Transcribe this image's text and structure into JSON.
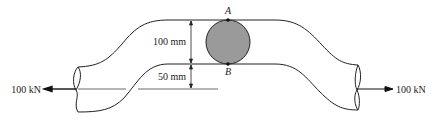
{
  "figure": {
    "type": "offset-bar-tension-diagram",
    "colors": {
      "stroke": "#222222",
      "section_fill": "#9a9a9a",
      "background": "#ffffff"
    }
  },
  "labels": {
    "point_top": "A",
    "point_bottom": "B",
    "dim_upper": "100 mm",
    "dim_lower": "50 mm",
    "load_left": "100 kN",
    "load_right": "100 kN"
  },
  "dimensions": {
    "offset_section_depth_mm": 100,
    "eccentricity_mm": 50
  },
  "loads": [
    {
      "side": "left",
      "magnitude": "100 kN",
      "direction": "left"
    },
    {
      "side": "right",
      "magnitude": "100 kN",
      "direction": "right"
    }
  ]
}
